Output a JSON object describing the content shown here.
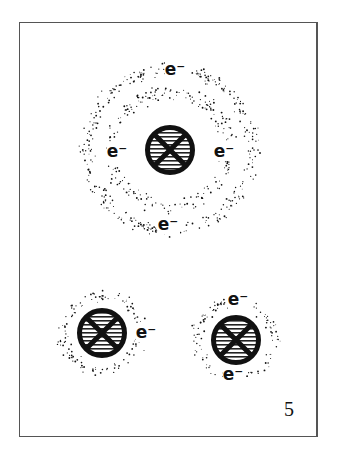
{
  "figure": {
    "number": "5",
    "electron_symbol": "e⁻",
    "colors": {
      "ink": "#111111",
      "frame": "#555555",
      "background": "#ffffff"
    },
    "atoms": [
      {
        "name": "large-atom",
        "center": [
          170,
          150
        ],
        "nucleus_radius": 25,
        "shells": [
          {
            "inner": 48,
            "outer": 70
          },
          {
            "inner": 72,
            "outer": 94
          }
        ],
        "electrons": [
          {
            "label": "e⁻",
            "x": 175,
            "y": 75
          },
          {
            "label": "e⁻",
            "x": 117,
            "y": 157
          },
          {
            "label": "e⁻",
            "x": 224,
            "y": 157
          },
          {
            "label": "e⁻",
            "x": 168,
            "y": 230
          }
        ]
      },
      {
        "name": "small-atom-left",
        "center": [
          102,
          333
        ],
        "nucleus_radius": 25,
        "shells": [
          {
            "inner": 30,
            "outer": 48
          }
        ],
        "electrons": [
          {
            "label": "e⁻",
            "x": 146,
            "y": 338
          }
        ]
      },
      {
        "name": "small-atom-right",
        "center": [
          236,
          340
        ],
        "nucleus_radius": 25,
        "shells": [
          {
            "inner": 30,
            "outer": 48
          }
        ],
        "electrons": [
          {
            "label": "e⁻",
            "x": 238,
            "y": 305
          },
          {
            "label": "e⁻",
            "x": 233,
            "y": 380
          }
        ]
      }
    ]
  }
}
